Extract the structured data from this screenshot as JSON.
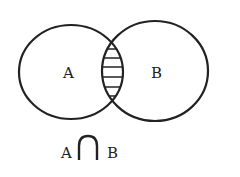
{
  "diagram": {
    "type": "venn",
    "sets": [
      {
        "label": "A"
      },
      {
        "label": "B"
      }
    ],
    "shaded_region": "intersection",
    "caption": {
      "left": "A",
      "operator": "∩",
      "right": "B"
    },
    "colors": {
      "stroke": "#222222",
      "background": "#ffffff"
    }
  }
}
